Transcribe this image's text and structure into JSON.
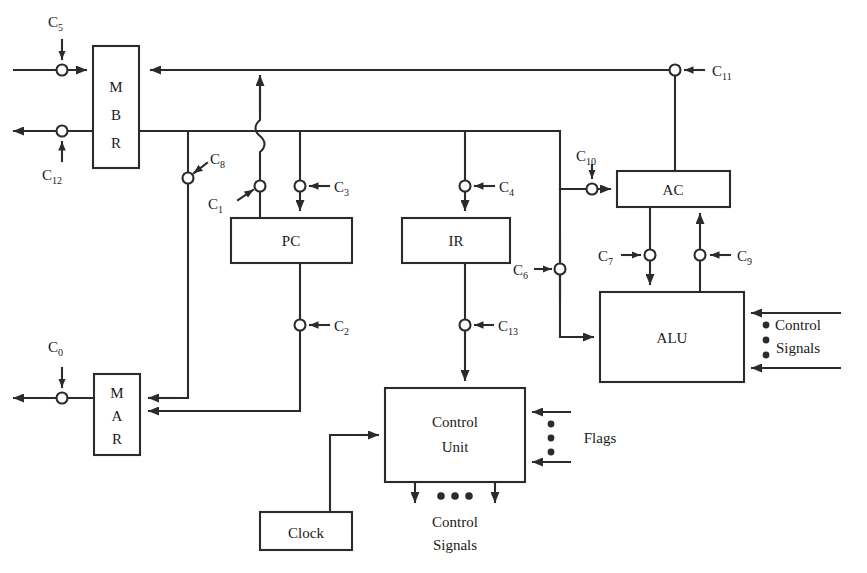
{
  "diagram": {
    "stroke_color": "#2b2b2b",
    "background": "#ffffff",
    "blocks": [
      {
        "id": "mbr",
        "label": "MBR",
        "label_lines": [
          "M",
          "B",
          "R"
        ],
        "x": 93,
        "y": 46,
        "w": 46,
        "h": 122,
        "orientation": "vertical"
      },
      {
        "id": "mar",
        "label": "MAR",
        "label_lines": [
          "M",
          "A",
          "R"
        ],
        "x": 94,
        "y": 374,
        "w": 46,
        "h": 81,
        "orientation": "vertical"
      },
      {
        "id": "pc",
        "label": "PC",
        "label_lines": [
          "PC"
        ],
        "x": 231,
        "y": 218,
        "w": 121,
        "h": 45,
        "orientation": "horizontal"
      },
      {
        "id": "ir",
        "label": "IR",
        "label_lines": [
          "IR"
        ],
        "x": 402,
        "y": 218,
        "w": 108,
        "h": 45,
        "orientation": "horizontal"
      },
      {
        "id": "ac",
        "label": "AC",
        "label_lines": [
          "AC"
        ],
        "x": 617,
        "y": 171,
        "w": 113,
        "h": 36,
        "orientation": "horizontal"
      },
      {
        "id": "alu",
        "label": "ALU",
        "label_lines": [
          "ALU"
        ],
        "x": 600,
        "y": 292,
        "w": 144,
        "h": 90,
        "orientation": "horizontal"
      },
      {
        "id": "cu",
        "label": "Control Unit",
        "label_lines": [
          "Control",
          "Unit"
        ],
        "x": 385,
        "y": 388,
        "w": 140,
        "h": 94,
        "orientation": "horizontal"
      },
      {
        "id": "clock",
        "label": "Clock",
        "label_lines": [
          "Clock"
        ],
        "x": 260,
        "y": 512,
        "w": 92,
        "h": 38,
        "orientation": "horizontal"
      }
    ],
    "control_signals": [
      {
        "id": "c0",
        "base": "C",
        "sub": "0",
        "label": "C0",
        "cx": 62,
        "cy": 398,
        "label_x": 48,
        "label_y": 352,
        "arrow": "down"
      },
      {
        "id": "c1",
        "base": "C",
        "sub": "1",
        "label": "C1",
        "cx": 260,
        "cy": 186,
        "label_x": 208,
        "label_y": 209,
        "arrow": "up-right"
      },
      {
        "id": "c2",
        "base": "C",
        "sub": "2",
        "label": "C2",
        "cx": 300,
        "cy": 325,
        "label_x": 330,
        "label_y": 331,
        "arrow": "left"
      },
      {
        "id": "c3",
        "base": "C",
        "sub": "3",
        "label": "C3",
        "cx": 300,
        "cy": 186,
        "label_x": 330,
        "label_y": 192,
        "arrow": "left"
      },
      {
        "id": "c4",
        "base": "C",
        "sub": "4",
        "label": "C4",
        "cx": 465,
        "cy": 186,
        "label_x": 495,
        "label_y": 192,
        "arrow": "left"
      },
      {
        "id": "c5",
        "base": "C",
        "sub": "5",
        "label": "C5",
        "cx": 62,
        "cy": 70,
        "label_x": 48,
        "label_y": 24,
        "arrow": "down"
      },
      {
        "id": "c6",
        "base": "C",
        "sub": "6",
        "label": "C6",
        "cx": 570,
        "cy": 269,
        "label_x": 520,
        "label_y": 275,
        "arrow": "right"
      },
      {
        "id": "c7",
        "base": "C",
        "sub": "7",
        "label": "C7",
        "cx": 650,
        "cy": 255,
        "label_x": 604,
        "label_y": 261,
        "arrow": "right"
      },
      {
        "id": "c8",
        "base": "C",
        "sub": "8",
        "label": "C8",
        "cx": 188,
        "cy": 178,
        "label_x": 208,
        "label_y": 161,
        "arrow": "down-left"
      },
      {
        "id": "c9",
        "base": "C",
        "sub": "9",
        "label": "C9",
        "cx": 700,
        "cy": 255,
        "label_x": 733,
        "label_y": 261,
        "arrow": "left"
      },
      {
        "id": "c10",
        "base": "C",
        "sub": "10",
        "label": "C10",
        "cx": 592,
        "cy": 189,
        "label_x": 575,
        "label_y": 160,
        "arrow": "down"
      },
      {
        "id": "c11",
        "base": "C",
        "sub": "11",
        "label": "C11",
        "cx": 675,
        "cy": 70,
        "label_x": 705,
        "label_y": 76,
        "arrow": "left"
      },
      {
        "id": "c12",
        "base": "C",
        "sub": "12",
        "label": "C12",
        "cx": 62,
        "cy": 131,
        "label_x": 44,
        "label_y": 178,
        "arrow": "up"
      },
      {
        "id": "c13",
        "base": "C",
        "sub": "13",
        "label": "C13",
        "cx": 465,
        "cy": 325,
        "label_x": 494,
        "label_y": 331,
        "arrow": "left"
      }
    ],
    "annotations": [
      {
        "id": "alu-control-signals",
        "lines": [
          "Control",
          "Signals"
        ],
        "x": 798,
        "y": 330,
        "anchor": "middle"
      },
      {
        "id": "cu-flags",
        "lines": [
          "Flags"
        ],
        "x": 600,
        "y": 437,
        "anchor": "middle"
      },
      {
        "id": "cu-control-signals",
        "lines": [
          "Control",
          "Signals"
        ],
        "x": 455,
        "y": 523,
        "anchor": "middle"
      }
    ],
    "buses": {
      "top_return_y": 70,
      "main_bus_y": 131,
      "main_bus_x_start": 139,
      "main_bus_x_end": 560
    }
  }
}
